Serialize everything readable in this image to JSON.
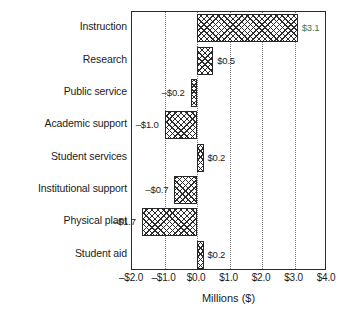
{
  "chart_data": {
    "type": "bar",
    "orientation": "horizontal",
    "title": "",
    "xlabel": "Millions ($)",
    "ylabel": "",
    "categories": [
      "Instruction",
      "Research",
      "Public service",
      "Academic support",
      "Student services",
      "Institutional support",
      "Physical plant",
      "Student aid"
    ],
    "values": [
      3.1,
      0.5,
      -0.2,
      -1.0,
      0.2,
      -0.7,
      -1.7,
      0.2
    ],
    "value_labels": [
      "$3.1",
      "$0.5",
      "–$0.2",
      "–$1.0",
      "$0.2",
      "–$0.7",
      "–$1.7",
      "$0.2"
    ],
    "xlim": [
      -2.0,
      4.0
    ],
    "xticks": [
      -2.0,
      -1.0,
      0.0,
      1.0,
      2.0,
      3.0,
      4.0
    ],
    "xtick_labels": [
      "–$2.0",
      "–$1.0",
      "$0.0",
      "$1.0",
      "$2.0",
      "$3.0",
      "$4.0"
    ],
    "grid": "vertical-dotted",
    "legend": "none",
    "bar_fill": "cross-hatch",
    "colors": {
      "bar_edge": "#262626",
      "bar_fill": "#ffffff",
      "hatch": "#2b2b2b",
      "grid": "#777777",
      "frame": "#2a2a2a",
      "text": "#1b1b1b",
      "highlight_label": "#3c7a50"
    }
  }
}
